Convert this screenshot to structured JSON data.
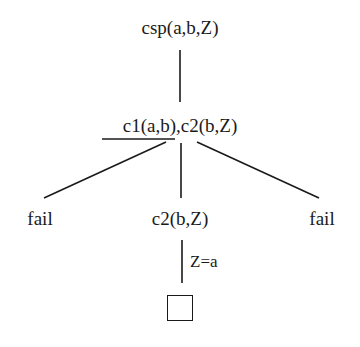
{
  "diagram": {
    "type": "SLD resolution tree",
    "root": {
      "label": "csp(a,b,Z)"
    },
    "level1": {
      "selected_literal": "c1(a,b)",
      "separator": ",",
      "remaining_literal": "c2(b,Z)"
    },
    "level2": {
      "left": "fail",
      "middle": "c2(b,Z)",
      "right": "fail"
    },
    "edge_labels": {
      "middle_to_success": "Z=a"
    },
    "leaf": {
      "symbol": "empty-clause-box",
      "meaning": "success"
    },
    "colors": {
      "ink": "#1a1a1a",
      "background": "#ffffff"
    }
  }
}
